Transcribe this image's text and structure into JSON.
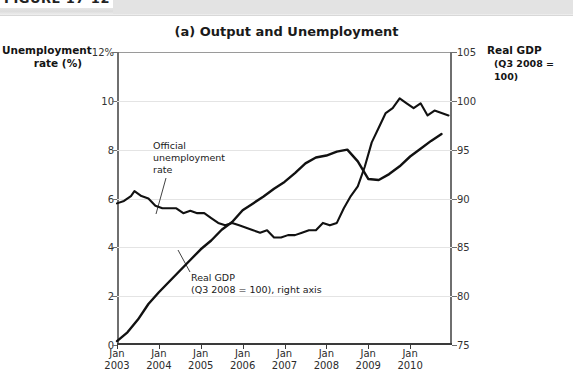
{
  "figure": {
    "band_label": "FIGURE 17-12"
  },
  "chart_title": "(a) Output and Unemployment",
  "axis_titles": {
    "left_line1": "Unemployment",
    "left_line2": "rate (%)",
    "right_line1": "Real GDP",
    "right_line2": "(Q3 2008 = 100)"
  },
  "annotations": {
    "unemployment": {
      "line1": "Official",
      "line2": "unemployment",
      "line3": "rate"
    },
    "gdp": {
      "line1": "Real GDP",
      "line2": "(Q3 2008 = 100), right axis"
    }
  },
  "chart_data": {
    "type": "line",
    "title": "(a) Output and Unemployment",
    "xlabel": "",
    "ylabel": "Unemployment rate (%)",
    "ylabel_right": "Real GDP (Q3 2008 = 100)",
    "grid": true,
    "legend": "annotations-inline",
    "xlim": [
      "2003-01",
      "2011-01"
    ],
    "x_tick_labels": [
      {
        "month": "Jan",
        "year": "2003"
      },
      {
        "month": "Jan",
        "year": "2004"
      },
      {
        "month": "Jan",
        "year": "2005"
      },
      {
        "month": "Jan",
        "year": "2006"
      },
      {
        "month": "Jan",
        "year": "2007"
      },
      {
        "month": "Jan",
        "year": "2008"
      },
      {
        "month": "Jan",
        "year": "2009"
      },
      {
        "month": "Jan",
        "year": "2010"
      }
    ],
    "ylim_left": [
      0,
      12
    ],
    "y_ticks_left": [
      "0",
      "2",
      "4",
      "6",
      "8",
      "10",
      "12%"
    ],
    "ylim_right": [
      75,
      105
    ],
    "y_ticks_right": [
      "75",
      "80",
      "85",
      "90",
      "95",
      "100",
      "105"
    ],
    "series": [
      {
        "name": "Official unemployment rate",
        "axis": "left",
        "unit": "percent",
        "x": [
          "2003-01",
          "2003-03",
          "2003-05",
          "2003-06",
          "2003-08",
          "2003-10",
          "2003-12",
          "2004-02",
          "2004-04",
          "2004-06",
          "2004-08",
          "2004-10",
          "2004-12",
          "2005-02",
          "2005-04",
          "2005-06",
          "2005-08",
          "2005-10",
          "2005-12",
          "2006-02",
          "2006-04",
          "2006-06",
          "2006-08",
          "2006-10",
          "2006-12",
          "2007-02",
          "2007-04",
          "2007-06",
          "2007-08",
          "2007-10",
          "2007-12",
          "2008-02",
          "2008-04",
          "2008-06",
          "2008-08",
          "2008-10",
          "2008-12",
          "2009-02",
          "2009-04",
          "2009-06",
          "2009-08",
          "2009-10",
          "2009-12",
          "2010-02",
          "2010-04",
          "2010-06",
          "2010-08",
          "2010-10",
          "2010-12"
        ],
        "values": [
          5.8,
          5.9,
          6.1,
          6.3,
          6.1,
          6.0,
          5.7,
          5.6,
          5.6,
          5.6,
          5.4,
          5.5,
          5.4,
          5.4,
          5.2,
          5.0,
          4.9,
          5.0,
          4.9,
          4.8,
          4.7,
          4.6,
          4.7,
          4.4,
          4.4,
          4.5,
          4.5,
          4.6,
          4.7,
          4.7,
          5.0,
          4.9,
          5.0,
          5.6,
          6.1,
          6.5,
          7.3,
          8.3,
          8.9,
          9.5,
          9.7,
          10.1,
          9.9,
          9.7,
          9.9,
          9.4,
          9.6,
          9.5,
          9.4
        ]
      },
      {
        "name": "Real GDP (Q3 2008 = 100)",
        "axis": "right",
        "unit": "index",
        "x": [
          "2003-01",
          "2003-04",
          "2003-07",
          "2003-10",
          "2004-01",
          "2004-04",
          "2004-07",
          "2004-10",
          "2005-01",
          "2005-04",
          "2005-07",
          "2005-10",
          "2006-01",
          "2006-04",
          "2006-07",
          "2006-10",
          "2007-01",
          "2007-04",
          "2007-07",
          "2007-10",
          "2008-01",
          "2008-04",
          "2008-07",
          "2008-10",
          "2009-01",
          "2009-04",
          "2009-07",
          "2009-10",
          "2010-01",
          "2010-04",
          "2010-07",
          "2010-10"
        ],
        "values": [
          75.4,
          76.3,
          77.6,
          79.2,
          80.4,
          81.5,
          82.6,
          83.7,
          84.8,
          85.7,
          86.8,
          87.6,
          88.8,
          89.5,
          90.2,
          91.0,
          91.7,
          92.6,
          93.6,
          94.2,
          94.4,
          94.8,
          95.0,
          93.8,
          92.0,
          91.9,
          92.5,
          93.3,
          94.3,
          95.1,
          95.9,
          96.6
        ]
      }
    ],
    "note": "Unemployment rate plotted against left axis (0-12%); Real GDP index plotted against right axis (75-105)."
  }
}
